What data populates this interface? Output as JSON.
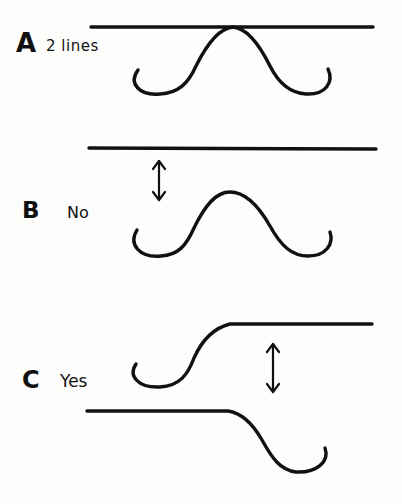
{
  "diagram": {
    "colors": {
      "ink": "#111111",
      "paper": "#fdfdfc"
    },
    "panels": [
      {
        "id": "A",
        "label": "A",
        "note": "2 lines",
        "description": "Horizontal line touching the peak of a wave curve"
      },
      {
        "id": "B",
        "label": "B",
        "note": "No",
        "description": "Horizontal line separated from a wave curve by a gap (double-headed arrow)"
      },
      {
        "id": "C",
        "label": "C",
        "note": "Yes",
        "description": "Two offset S-shaped curves with a gap between their flat portions (double-headed arrow)"
      }
    ]
  }
}
